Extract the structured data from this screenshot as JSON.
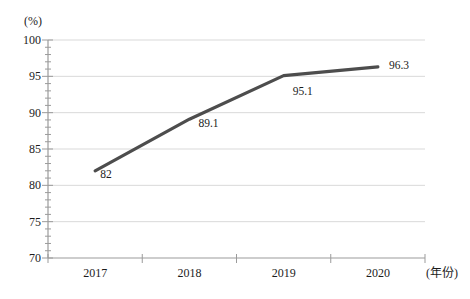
{
  "chart_data": {
    "type": "line",
    "title": "",
    "categories": [
      "2017",
      "2018",
      "2019",
      "2020"
    ],
    "series": [
      {
        "name": "",
        "values": [
          82,
          89.1,
          95.1,
          96.3
        ]
      }
    ],
    "point_labels": [
      "82",
      "89.1",
      "95.1",
      "96.3"
    ],
    "ylabel": "(%)",
    "xlabel": "(年份)",
    "ylim": [
      70,
      100
    ],
    "y_major_step": 5,
    "y_minor_step": 1,
    "y_tick_labels": [
      "70",
      "75",
      "80",
      "85",
      "90",
      "95",
      "100"
    ],
    "grid": "horizontal gridlines at major y ticks",
    "legend": "none",
    "colors": {
      "line": "#4d4d4d",
      "grid": "#d9d9d9",
      "axis": "#9b9b9b",
      "text": "#1c1c1c",
      "background": "#ffffff"
    }
  }
}
